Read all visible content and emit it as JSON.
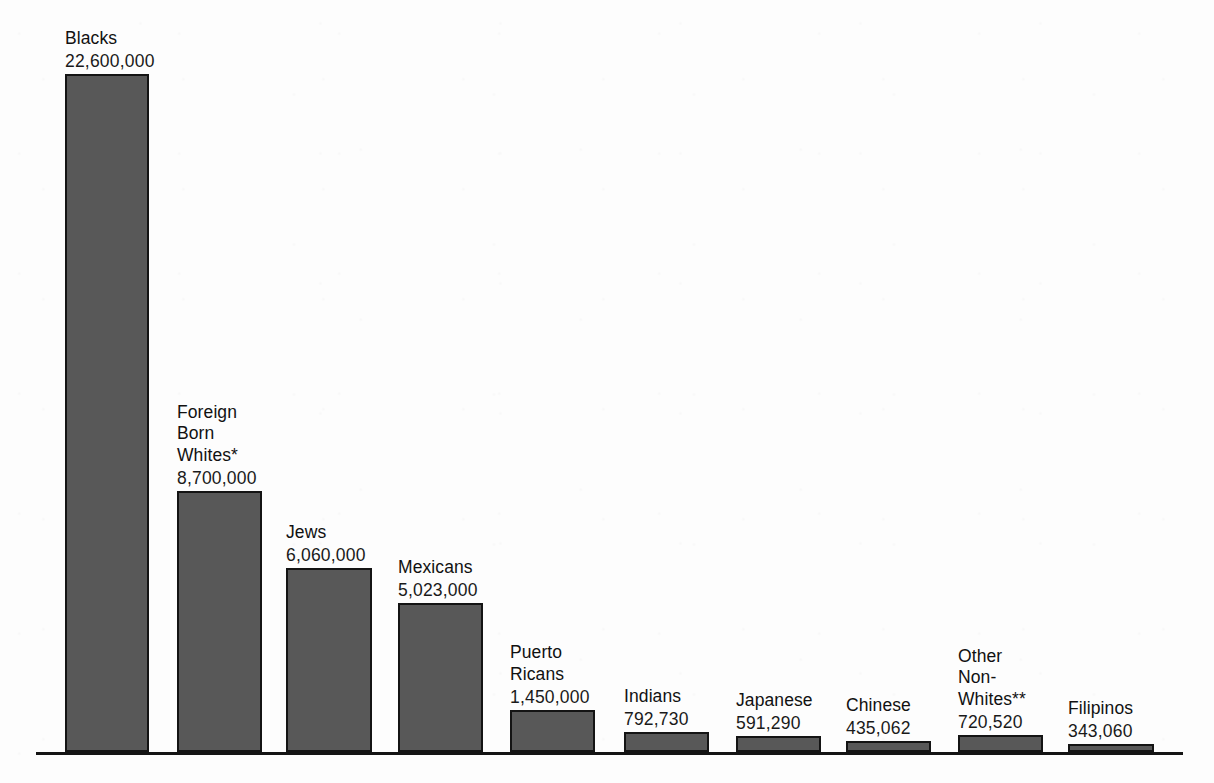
{
  "chart_data": {
    "type": "bar",
    "title": "",
    "subtitle": "",
    "xlabel": "",
    "ylabel": "",
    "grid": false,
    "legend": "none",
    "orientation": "vertical",
    "axis_baseline": true,
    "ylim": [
      0,
      22600000
    ],
    "categories": [
      "Blacks",
      "Foreign Born Whites*",
      "Jews",
      "Mexicans",
      "Puerto Ricans",
      "Indians",
      "Japanese",
      "Chinese",
      "Other Non-Whites**",
      "Filipinos"
    ],
    "values": [
      22600000,
      8700000,
      6060000,
      5023000,
      1450000,
      792730,
      591290,
      435062,
      720520,
      343060
    ],
    "value_labels": [
      "22,600,000",
      "8,700,000",
      "6,060,000",
      "5,023,000",
      "1,450,000",
      "792,730",
      "591,290",
      "435,062",
      "720,520",
      "343,060"
    ],
    "bar_color": "#585858",
    "bar_outline_color": "#141414",
    "background_color": "#fdfdfd"
  },
  "bars": [
    {
      "name_lines": [
        "Blacks"
      ],
      "value_label": "22,600,000",
      "value": 22600000,
      "left": 65,
      "width": 84,
      "top": 74
    },
    {
      "name_lines": [
        "Foreign",
        "Born",
        "Whites*"
      ],
      "value_label": "8,700,000",
      "value": 8700000,
      "left": 177,
      "width": 85,
      "top": 491
    },
    {
      "name_lines": [
        "Jews"
      ],
      "value_label": "6,060,000",
      "value": 6060000,
      "left": 286,
      "width": 86,
      "top": 568
    },
    {
      "name_lines": [
        "Mexicans"
      ],
      "value_label": "5,023,000",
      "value": 5023000,
      "left": 398,
      "width": 85,
      "top": 603
    },
    {
      "name_lines": [
        "Puerto",
        "Ricans"
      ],
      "value_label": "1,450,000",
      "value": 1450000,
      "left": 510,
      "width": 85,
      "top": 710
    },
    {
      "name_lines": [
        "Indians"
      ],
      "value_label": "792,730",
      "value": 792730,
      "left": 624,
      "width": 85,
      "top": 732
    },
    {
      "name_lines": [
        "Japanese"
      ],
      "value_label": "591,290",
      "value": 591290,
      "left": 736,
      "width": 85,
      "top": 736
    },
    {
      "name_lines": [
        "Chinese"
      ],
      "value_label": "435,062",
      "value": 435062,
      "left": 846,
      "width": 85,
      "top": 741
    },
    {
      "name_lines": [
        "Other",
        "Non-",
        "Whites**"
      ],
      "value_label": "720,520",
      "value": 720520,
      "left": 958,
      "width": 85,
      "top": 735
    },
    {
      "name_lines": [
        "Filipinos"
      ],
      "value_label": "343,060",
      "value": 343060,
      "left": 1068,
      "width": 86,
      "top": 744
    }
  ],
  "axis": {
    "baseline_left": 36,
    "baseline_right": 1183,
    "baseline_y": 752,
    "baseline_thickness": 3
  }
}
